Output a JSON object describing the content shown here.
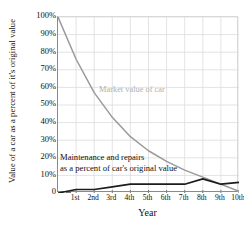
{
  "chart_data": {
    "type": "line",
    "title": "",
    "xlabel": "Year",
    "ylabel": "Value of a car as a percent of it's original value",
    "categories": [
      "1st",
      "2nd",
      "3rd",
      "4th",
      "5th",
      "6th",
      "7th",
      "8th",
      "9th",
      "10th"
    ],
    "ytick_labels": [
      "0",
      "10%",
      "20%",
      "30%",
      "40%",
      "50%",
      "60%",
      "70%",
      "80%",
      "90%",
      "100%"
    ],
    "ytick_values": [
      0,
      10,
      20,
      30,
      40,
      50,
      60,
      70,
      80,
      90,
      100
    ],
    "ylim": [
      0,
      100
    ],
    "xlim": [
      0,
      10
    ],
    "grid": true,
    "legend_position": "in-plot annotations",
    "series": [
      {
        "name": "Market value of car",
        "label": "Market value of car",
        "color": "#9a9a9a",
        "x": [
          0,
          1,
          2,
          3,
          4,
          5,
          6,
          7,
          8,
          9,
          10
        ],
        "values": [
          100,
          76,
          57,
          43,
          32,
          24,
          18,
          13,
          9,
          5,
          1
        ]
      },
      {
        "name": "Maintenance and repairs as a percent of car's original value",
        "label_line1": "Maintenance and repairs",
        "label_line2": "as a percent of car's original value",
        "color": "#1c1c1c",
        "x": [
          0,
          1,
          2,
          3,
          4,
          5,
          6,
          7,
          8,
          9,
          10
        ],
        "values": [
          0,
          2,
          2,
          3.5,
          5,
          5,
          5,
          5,
          8,
          5,
          6
        ]
      }
    ],
    "annotations": [
      {
        "text": "Market value of car",
        "color": "#b0b0b0"
      },
      {
        "text": "Maintenance and repairs",
        "color": "#111111"
      },
      {
        "text": "as a percent of car's original value",
        "color": "#111111"
      }
    ]
  }
}
